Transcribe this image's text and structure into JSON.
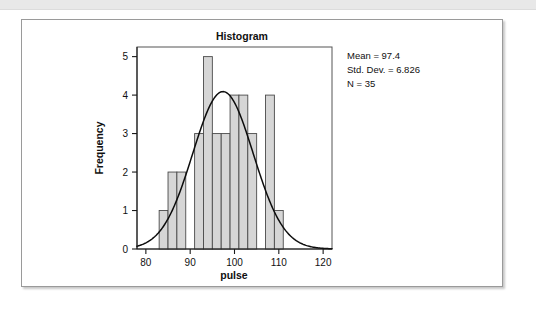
{
  "page": {
    "background_color": "#ffffff",
    "top_strip_color": "#e8e8e8"
  },
  "card": {
    "border_color": "#9a9a9a",
    "background_color": "#ffffff"
  },
  "stats_box": {
    "mean_label": "Mean = 97.4",
    "std_dev_label": "Std. Dev. = 6.826",
    "n_label": "N = 35"
  },
  "chart_data": {
    "type": "bar",
    "title": "Histogram",
    "xlabel": "pulse",
    "ylabel": "Frequency",
    "xlim": [
      78,
      122
    ],
    "ylim": [
      0,
      5.25
    ],
    "xticks": [
      80,
      90,
      100,
      110,
      120
    ],
    "yticks": [
      0,
      1,
      2,
      3,
      4,
      5
    ],
    "xtick_labels": [
      "80",
      "90",
      "100",
      "110",
      "120"
    ],
    "ytick_labels": [
      "0",
      "1",
      "2",
      "3",
      "4",
      "5"
    ],
    "grid": false,
    "legend": false,
    "bar_fill_color": "#d6d6d6",
    "bar_edge_color": "#4a4a4a",
    "bin_width": 2,
    "bins": [
      {
        "start": 83,
        "end": 85,
        "count": 1
      },
      {
        "start": 85,
        "end": 87,
        "count": 2
      },
      {
        "start": 87,
        "end": 89,
        "count": 2
      },
      {
        "start": 91,
        "end": 93,
        "count": 3
      },
      {
        "start": 93,
        "end": 95,
        "count": 5
      },
      {
        "start": 95,
        "end": 97,
        "count": 3
      },
      {
        "start": 97,
        "end": 99,
        "count": 3
      },
      {
        "start": 99,
        "end": 101,
        "count": 4
      },
      {
        "start": 101,
        "end": 103,
        "count": 4
      },
      {
        "start": 103,
        "end": 105,
        "count": 3
      },
      {
        "start": 107,
        "end": 109,
        "count": 4
      },
      {
        "start": 109,
        "end": 111,
        "count": 1
      }
    ],
    "categories": [
      "83-85",
      "85-87",
      "87-89",
      "91-93",
      "93-95",
      "95-97",
      "97-99",
      "99-101",
      "101-103",
      "103-105",
      "107-109",
      "109-111"
    ],
    "values": [
      1,
      2,
      2,
      3,
      5,
      3,
      3,
      4,
      4,
      3,
      4,
      1
    ],
    "overlay_curve": {
      "type": "normal",
      "mean": 97.4,
      "std_dev": 6.826,
      "n": 35,
      "bin_width": 2,
      "peak_value": 4.09,
      "color": "#0d0d0d"
    }
  }
}
